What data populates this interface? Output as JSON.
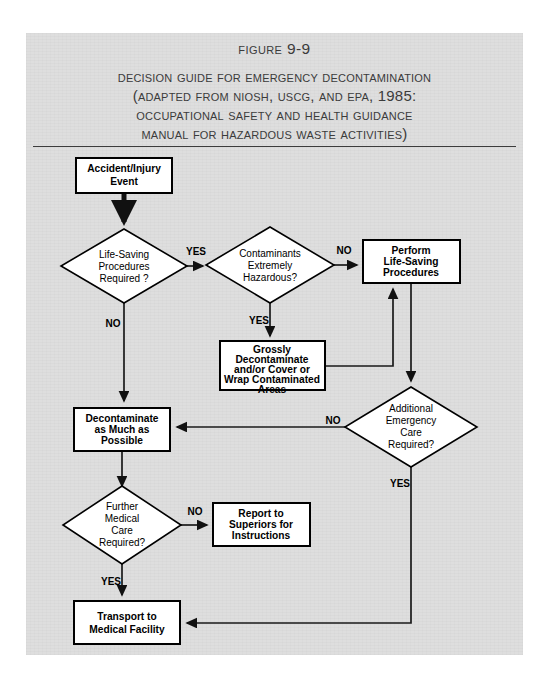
{
  "figure": {
    "number": "Figure 9-9",
    "title_lines": [
      "Decision guide for emergency decontamination",
      "(Adapted from NIOSH, USCG, and EPA, 1985:",
      "Occupational Safety and Health Guidance",
      "Manual for Hazardous Waste Activities)"
    ]
  },
  "colors": {
    "page_background": "#dedede",
    "node_fill": "#ffffff",
    "stroke": "#000000",
    "title_text": "#3b3b3b"
  },
  "flowchart": {
    "type": "decision-flowchart",
    "nodes": [
      {
        "id": "accident",
        "shape": "process",
        "lines": [
          "Accident/Injury",
          "Event"
        ],
        "x": 76,
        "y": 158,
        "w": 96,
        "h": 35
      },
      {
        "id": "life_saving_q",
        "shape": "decision",
        "lines": [
          "Life-Saving",
          "Procedures",
          "Required ?"
        ],
        "cx": 124,
        "cy": 266,
        "w": 126,
        "h": 74
      },
      {
        "id": "contaminants_q",
        "shape": "decision",
        "lines": [
          "Contaminants",
          "Extremely",
          "Hazardous?"
        ],
        "cx": 270,
        "cy": 265,
        "w": 128,
        "h": 76
      },
      {
        "id": "perform_life_saving",
        "shape": "process",
        "lines": [
          "Perform",
          "Life-Saving",
          "Procedures"
        ],
        "x": 363,
        "y": 240,
        "w": 97,
        "h": 43
      },
      {
        "id": "grossly_decon",
        "shape": "process",
        "lines": [
          "Grossly",
          "Decontaminate",
          "and/or Cover or",
          "Wrap Contaminated",
          "Areas"
        ],
        "x": 220,
        "y": 341,
        "w": 105,
        "h": 49
      },
      {
        "id": "decontaminate",
        "shape": "process",
        "lines": [
          "Decontaminate",
          "as Much as",
          "Possible"
        ],
        "x": 74,
        "y": 408,
        "w": 96,
        "h": 43
      },
      {
        "id": "additional_care_q",
        "shape": "decision",
        "lines": [
          "Additional",
          "Emergency",
          "Care",
          "Required?"
        ],
        "cx": 411,
        "cy": 427,
        "w": 132,
        "h": 80
      },
      {
        "id": "further_medical_q",
        "shape": "decision",
        "lines": [
          "Further",
          "Medical",
          "Care",
          "Required?"
        ],
        "cx": 122,
        "cy": 525,
        "w": 118,
        "h": 78
      },
      {
        "id": "report_superiors",
        "shape": "process",
        "lines": [
          "Report to",
          "Superiors for",
          "Instructions"
        ],
        "x": 213,
        "y": 503,
        "w": 97,
        "h": 43
      },
      {
        "id": "transport",
        "shape": "process",
        "lines": [
          "Transport to",
          "Medical Facility"
        ],
        "x": 74,
        "y": 601,
        "w": 106,
        "h": 43
      }
    ],
    "edges": [
      {
        "from": "accident",
        "to": "life_saving_q",
        "label": ""
      },
      {
        "from": "life_saving_q",
        "to": "contaminants_q",
        "label": "YES"
      },
      {
        "from": "life_saving_q",
        "to": "decontaminate",
        "label": "NO"
      },
      {
        "from": "contaminants_q",
        "to": "perform_life_saving",
        "label": "NO"
      },
      {
        "from": "contaminants_q",
        "to": "grossly_decon",
        "label": "YES"
      },
      {
        "from": "grossly_decon",
        "to": "perform_life_saving",
        "label": ""
      },
      {
        "from": "perform_life_saving",
        "to": "additional_care_q",
        "label": ""
      },
      {
        "from": "additional_care_q",
        "to": "decontaminate",
        "label": "NO"
      },
      {
        "from": "additional_care_q",
        "to": "transport",
        "label": "YES"
      },
      {
        "from": "decontaminate",
        "to": "further_medical_q",
        "label": ""
      },
      {
        "from": "further_medical_q",
        "to": "report_superiors",
        "label": "NO"
      },
      {
        "from": "further_medical_q",
        "to": "transport",
        "label": "YES"
      }
    ],
    "edge_labels": {
      "yes_life_saving": "YES",
      "no_life_saving": "NO",
      "no_contaminants": "NO",
      "yes_contaminants": "YES",
      "no_additional": "NO",
      "yes_additional": "YES",
      "no_further": "NO",
      "yes_further": "YES"
    }
  }
}
